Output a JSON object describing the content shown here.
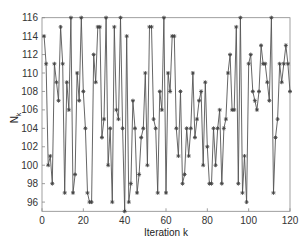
{
  "chart_data": {
    "type": "line",
    "title": "",
    "xlabel": "Iteration k",
    "ylabel": "N_k",
    "xlim": [
      0,
      120
    ],
    "ylim": [
      95,
      116
    ],
    "xticks": [
      0,
      20,
      40,
      60,
      80,
      100,
      120
    ],
    "yticks": [
      96,
      98,
      100,
      102,
      104,
      106,
      108,
      110,
      112,
      114,
      116
    ],
    "grid": false,
    "legend": null,
    "marker": "asterisk",
    "line_color": "#555555",
    "series": [
      {
        "name": "N_k",
        "x": [
          1,
          2,
          3,
          4,
          5,
          6,
          7,
          8,
          9,
          10,
          11,
          12,
          13,
          14,
          15,
          16,
          17,
          18,
          19,
          20,
          21,
          22,
          23,
          24,
          25,
          26,
          27,
          28,
          29,
          30,
          31,
          32,
          33,
          34,
          35,
          36,
          37,
          38,
          39,
          40,
          41,
          42,
          43,
          44,
          45,
          46,
          47,
          48,
          49,
          50,
          51,
          52,
          53,
          54,
          55,
          56,
          57,
          58,
          59,
          60,
          61,
          62,
          63,
          64,
          65,
          66,
          67,
          68,
          69,
          70,
          71,
          72,
          73,
          74,
          75,
          76,
          77,
          78,
          79,
          80,
          81,
          82,
          83,
          84,
          85,
          86,
          87,
          88,
          89,
          90,
          91,
          92,
          93,
          94,
          95,
          96,
          97,
          98,
          99,
          100,
          101,
          102,
          103,
          104,
          105,
          106,
          107,
          108,
          109,
          110,
          111,
          112,
          113,
          114,
          115,
          116,
          117,
          118,
          119,
          120
        ],
        "values": [
          114,
          111,
          100,
          101,
          98,
          111,
          109,
          107,
          115,
          111,
          97,
          109,
          106,
          116,
          97,
          99,
          110,
          107,
          116,
          108,
          104,
          97,
          96,
          96,
          112,
          109,
          115,
          115,
          103,
          105,
          116,
          100,
          104,
          96,
          115,
          106,
          105,
          116,
          104,
          95,
          114,
          96,
          98,
          107,
          104,
          97,
          99,
          103,
          104,
          110,
          100,
          115,
          115,
          105,
          104,
          97,
          108,
          106,
          116,
          97,
          110,
          108,
          114,
          114,
          104,
          101,
          108,
          98,
          99,
          104,
          101,
          104,
          110,
          103,
          105,
          107,
          108,
          100,
          109,
          102,
          98,
          98,
          104,
          100,
          104,
          106,
          98,
          104,
          105,
          110,
          112,
          106,
          106,
          115,
          98,
          116,
          97,
          101,
          96,
          111,
          112,
          108,
          107,
          106,
          108,
          113,
          111,
          111,
          109,
          107,
          116,
          97,
          103,
          105,
          111,
          109,
          111,
          113,
          111,
          108
        ]
      }
    ]
  }
}
